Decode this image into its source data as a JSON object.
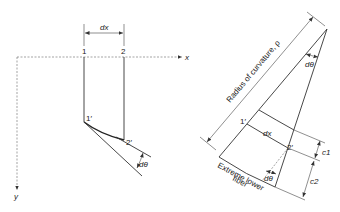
{
  "left_panel": {
    "dx_label": "dx",
    "point_1": "1",
    "point_2": "2",
    "point_1_prime": "1′",
    "point_2_prime": "2′",
    "d_theta": "dθ",
    "x_axis_label": "x",
    "y_axis_label": "y"
  },
  "right_panel": {
    "radius_label": "Radius of curvature, ρ",
    "d_theta_top": "dθ",
    "point_1_prime": "1′",
    "point_2_prime": "2′",
    "dx_label": "dx",
    "d_theta_bottom": "dθ",
    "c1_label": "c1",
    "c2_label": "c2",
    "c_sub_1": "1",
    "c_sub_2": "2",
    "fiber_label_line1": "Extreme lower",
    "fiber_label_line2": "fiber"
  },
  "colors": {
    "line": "#333333",
    "background": "#ffffff"
  }
}
